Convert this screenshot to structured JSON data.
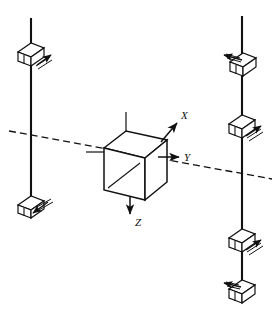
{
  "figure": {
    "background_color": "#ffffff",
    "line_color": "#111111",
    "width": 278,
    "height": 320
  },
  "axes": {
    "origin_label": "",
    "items": [
      {
        "name": "x-axis",
        "label": "X",
        "direction": "up-right",
        "label_x": 184,
        "label_y": 116,
        "arrow_from": [
          160,
          141
        ],
        "arrow_to": [
          178,
          122
        ]
      },
      {
        "name": "y-axis",
        "label": "Y",
        "direction": "right",
        "label_x": 188,
        "label_y": 159,
        "arrow_from": [
          157,
          157
        ],
        "arrow_to": [
          180,
          157
        ]
      },
      {
        "name": "z-axis",
        "label": "Z",
        "direction": "down",
        "label_x": 139,
        "label_y": 223,
        "arrow_from": [
          130,
          194
        ],
        "arrow_to": [
          130,
          215
        ]
      }
    ]
  },
  "cube": {
    "name": "central-cube-body",
    "front_face": [
      [
        104,
        148
      ],
      [
        104,
        190
      ],
      [
        145,
        200
      ],
      [
        145,
        158
      ]
    ],
    "top_face": [
      [
        104,
        148
      ],
      [
        126,
        131
      ],
      [
        167,
        140
      ],
      [
        145,
        158
      ]
    ],
    "right_face": [
      [
        145,
        158
      ],
      [
        167,
        140
      ],
      [
        167,
        182
      ],
      [
        145,
        200
      ]
    ],
    "diagonal_line": [
      [
        109,
        187
      ],
      [
        139,
        164
      ]
    ],
    "stub_top": [
      [
        126,
        112
      ],
      [
        126,
        148
      ]
    ],
    "stub_bottom": [
      [
        130,
        194
      ],
      [
        130,
        200
      ]
    ]
  },
  "dashed_reference_line": {
    "name": "dashed-axis-line",
    "from": [
      9,
      131
    ],
    "to": [
      272,
      179
    ],
    "style": "dashed",
    "dash_pattern": "7,4"
  },
  "guides": [
    {
      "name": "left-vertical-guide",
      "x": 31,
      "top_y": 18,
      "bottom_y": 212
    },
    {
      "name": "right-vertical-guide",
      "x": 242,
      "top_y": 16,
      "bottom_y": 298
    }
  ],
  "sliders": [
    {
      "name": "slider-left-upper",
      "guide": "left-vertical-guide",
      "center_x": 31,
      "center_y": 56,
      "arrow_direction": "up-right",
      "arrow_from": [
        36,
        64
      ],
      "arrow_to": [
        52,
        54
      ]
    },
    {
      "name": "slider-left-lower",
      "guide": "left-vertical-guide",
      "center_x": 31,
      "center_y": 208,
      "arrow_direction": "down-left",
      "arrow_from": [
        48,
        202
      ],
      "arrow_to": [
        31,
        213
      ]
    },
    {
      "name": "slider-right-upper",
      "guide": "right-vertical-guide",
      "center_x": 242,
      "center_y": 66,
      "arrow_direction": "up-left",
      "arrow_from": [
        244,
        62
      ],
      "arrow_to": [
        224,
        57
      ]
    },
    {
      "name": "slider-right-middle",
      "guide": "right-vertical-guide",
      "center_x": 242,
      "center_y": 128,
      "arrow_direction": "up-right",
      "arrow_from": [
        243,
        137
      ],
      "arrow_to": [
        261,
        126
      ]
    },
    {
      "name": "slider-right-lower",
      "guide": "right-vertical-guide",
      "center_x": 242,
      "center_y": 242,
      "arrow_direction": "up-right",
      "arrow_from": [
        243,
        251
      ],
      "arrow_to": [
        261,
        241
      ]
    },
    {
      "name": "slider-right-bottom",
      "guide": "right-vertical-guide",
      "center_x": 242,
      "center_y": 293,
      "arrow_direction": "left",
      "arrow_from": [
        243,
        290
      ],
      "arrow_to": [
        224,
        290
      ]
    }
  ]
}
